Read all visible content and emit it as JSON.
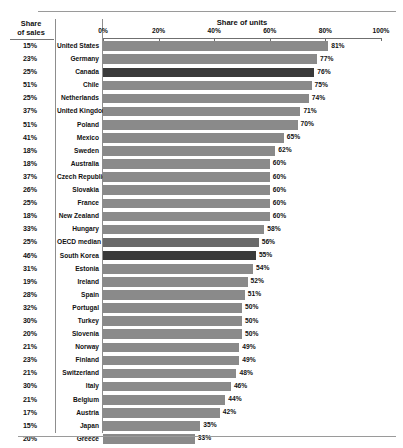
{
  "header": {
    "sales_column_label": "Share\nof sales",
    "sales_column_label_line1": "Share",
    "sales_column_label_line2": "of sales",
    "chart_title": "Share of units"
  },
  "axis": {
    "ticks": [
      "0%",
      "20%",
      "40%",
      "60%",
      "80%",
      "100%"
    ],
    "min": 0,
    "max": 100
  },
  "chart_data": {
    "type": "bar",
    "orientation": "horizontal",
    "title": "Share of units",
    "xlabel": "Share of units",
    "ylabel": "",
    "xlim": [
      0,
      100
    ],
    "tick_labels": [
      "0%",
      "20%",
      "40%",
      "60%",
      "80%",
      "100%"
    ],
    "grid": false,
    "legend": null,
    "secondary_column": {
      "header": "Share of sales",
      "values": [
        "15%",
        "23%",
        "25%",
        "51%",
        "25%",
        "37%",
        "51%",
        "41%",
        "18%",
        "18%",
        "37%",
        "26%",
        "25%",
        "18%",
        "33%",
        "25%",
        "46%",
        "31%",
        "19%",
        "28%",
        "32%",
        "30%",
        "20%",
        "21%",
        "23%",
        "21%",
        "30%",
        "21%",
        "17%",
        "15%",
        "20%"
      ]
    },
    "categories": [
      "United States",
      "Germany",
      "Canada",
      "Chile",
      "Netherlands",
      "United Kingdom",
      "Poland",
      "Mexico",
      "Sweden",
      "Australia",
      "Czech Republic",
      "Slovakia",
      "France",
      "New Zealand",
      "Hungary",
      "OECD median",
      "South Korea",
      "Estonia",
      "Ireland",
      "Spain",
      "Portugal",
      "Turkey",
      "Slovenia",
      "Norway",
      "Finland",
      "Switzerland",
      "Italy",
      "Belgium",
      "Austria",
      "Japan",
      "Greece"
    ],
    "values": [
      81,
      77,
      76,
      75,
      74,
      71,
      70,
      65,
      62,
      60,
      60,
      60,
      60,
      60,
      58,
      56,
      55,
      54,
      52,
      51,
      50,
      50,
      50,
      49,
      49,
      48,
      46,
      44,
      42,
      35,
      33
    ],
    "value_labels": [
      "81%",
      "77%",
      "76%",
      "75%",
      "74%",
      "71%",
      "70%",
      "65%",
      "62%",
      "60%",
      "60%",
      "60%",
      "60%",
      "60%",
      "58%",
      "56%",
      "55%",
      "54%",
      "52%",
      "51%",
      "50%",
      "50%",
      "50%",
      "49%",
      "49%",
      "48%",
      "46%",
      "44%",
      "42%",
      "35%",
      "33%"
    ],
    "highlight_categories": [
      "Canada",
      "South Korea"
    ],
    "median_category": "OECD median"
  },
  "rows": [
    {
      "sales": "15%",
      "country": "United States",
      "value": 81,
      "label": "81%",
      "style": "normal"
    },
    {
      "sales": "23%",
      "country": "Germany",
      "value": 77,
      "label": "77%",
      "style": "normal"
    },
    {
      "sales": "25%",
      "country": "Canada",
      "value": 76,
      "label": "76%",
      "style": "highlight"
    },
    {
      "sales": "51%",
      "country": "Chile",
      "value": 75,
      "label": "75%",
      "style": "normal"
    },
    {
      "sales": "25%",
      "country": "Netherlands",
      "value": 74,
      "label": "74%",
      "style": "normal"
    },
    {
      "sales": "37%",
      "country": "United Kingdom",
      "value": 71,
      "label": "71%",
      "style": "normal"
    },
    {
      "sales": "51%",
      "country": "Poland",
      "value": 70,
      "label": "70%",
      "style": "normal"
    },
    {
      "sales": "41%",
      "country": "Mexico",
      "value": 65,
      "label": "65%",
      "style": "normal"
    },
    {
      "sales": "18%",
      "country": "Sweden",
      "value": 62,
      "label": "62%",
      "style": "normal"
    },
    {
      "sales": "18%",
      "country": "Australia",
      "value": 60,
      "label": "60%",
      "style": "normal"
    },
    {
      "sales": "37%",
      "country": "Czech Republic",
      "value": 60,
      "label": "60%",
      "style": "normal"
    },
    {
      "sales": "26%",
      "country": "Slovakia",
      "value": 60,
      "label": "60%",
      "style": "normal"
    },
    {
      "sales": "25%",
      "country": "France",
      "value": 60,
      "label": "60%",
      "style": "normal"
    },
    {
      "sales": "18%",
      "country": "New Zealand",
      "value": 60,
      "label": "60%",
      "style": "normal"
    },
    {
      "sales": "33%",
      "country": "Hungary",
      "value": 58,
      "label": "58%",
      "style": "normal"
    },
    {
      "sales": "25%",
      "country": "OECD median",
      "value": 56,
      "label": "56%",
      "style": "mid"
    },
    {
      "sales": "46%",
      "country": "South Korea",
      "value": 55,
      "label": "55%",
      "style": "highlight"
    },
    {
      "sales": "31%",
      "country": "Estonia",
      "value": 54,
      "label": "54%",
      "style": "normal"
    },
    {
      "sales": "19%",
      "country": "Ireland",
      "value": 52,
      "label": "52%",
      "style": "normal"
    },
    {
      "sales": "28%",
      "country": "Spain",
      "value": 51,
      "label": "51%",
      "style": "normal"
    },
    {
      "sales": "32%",
      "country": "Portugal",
      "value": 50,
      "label": "50%",
      "style": "normal"
    },
    {
      "sales": "30%",
      "country": "Turkey",
      "value": 50,
      "label": "50%",
      "style": "normal"
    },
    {
      "sales": "20%",
      "country": "Slovenia",
      "value": 50,
      "label": "50%",
      "style": "normal"
    },
    {
      "sales": "21%",
      "country": "Norway",
      "value": 49,
      "label": "49%",
      "style": "normal"
    },
    {
      "sales": "23%",
      "country": "Finland",
      "value": 49,
      "label": "49%",
      "style": "normal"
    },
    {
      "sales": "21%",
      "country": "Switzerland",
      "value": 48,
      "label": "48%",
      "style": "normal"
    },
    {
      "sales": "30%",
      "country": "Italy",
      "value": 46,
      "label": "46%",
      "style": "normal"
    },
    {
      "sales": "21%",
      "country": "Belgium",
      "value": 44,
      "label": "44%",
      "style": "normal"
    },
    {
      "sales": "17%",
      "country": "Austria",
      "value": 42,
      "label": "42%",
      "style": "normal"
    },
    {
      "sales": "15%",
      "country": "Japan",
      "value": 35,
      "label": "35%",
      "style": "normal"
    },
    {
      "sales": "20%",
      "country": "Greece",
      "value": 33,
      "label": "33%",
      "style": "normal"
    }
  ],
  "colors": {
    "bar": "#8a8a8a",
    "bar_highlight": "#3a3a3a",
    "bar_median": "#6a6a6a",
    "rule": "#9a9a9a",
    "text": "#111111"
  }
}
